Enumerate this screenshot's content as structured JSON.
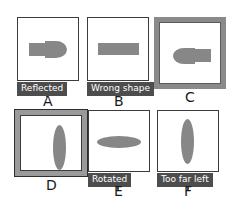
{
  "figure": {
    "background_color": "#ffffff",
    "shape_fill_color": "#878787",
    "panel_border_color": "#3c3c3c",
    "badge_background_color": "#4d4d4d",
    "badge_text_color": "#ffffff",
    "selected_border_color": "#8a8a8a"
  },
  "options": [
    {
      "letter": "A",
      "caption": "Reflected",
      "has_caption": true,
      "state": "plain",
      "content": "rectangle-left-pointed-ellipse-right"
    },
    {
      "letter": "B",
      "caption": "Wrong shape",
      "has_caption": true,
      "state": "plain",
      "content": "horizontal-rectangle"
    },
    {
      "letter": "C",
      "caption": "",
      "has_caption": false,
      "state": "selected",
      "content": "pointed-ellipse-left-rectangle-right"
    },
    {
      "letter": "D",
      "caption": "",
      "has_caption": false,
      "state": "focused",
      "content": "vertical-ellipse-centered"
    },
    {
      "letter": "E",
      "caption": "Rotated",
      "has_caption": true,
      "state": "plain",
      "content": "horizontal-ellipse"
    },
    {
      "letter": "F",
      "caption": "Too far left",
      "has_caption": true,
      "state": "plain",
      "content": "vertical-ellipse-left"
    }
  ]
}
